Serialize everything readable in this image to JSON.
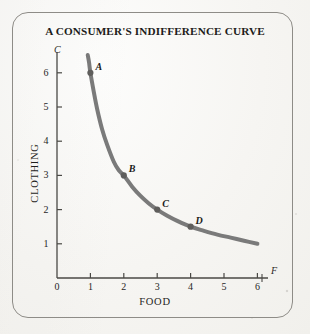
{
  "figure": {
    "title": "A CONSUMER'S INDIFFERENCE CURVE",
    "frame_color": "#8e8c87",
    "background_color": "#f6f5f2",
    "curve_color": "#7a7a7a",
    "axis_color": "#4a4945",
    "text_color": "#1d1c1a"
  },
  "axes": {
    "y_axis_letter": "C",
    "x_axis_letter": "F",
    "y_title": "CLOTHING",
    "x_title": "FOOD",
    "x_ticks": [
      "0",
      "1",
      "2",
      "3",
      "4",
      "5",
      "6"
    ],
    "y_ticks": [
      "1",
      "2",
      "3",
      "4",
      "5",
      "6"
    ]
  },
  "points": [
    {
      "label": "A",
      "x": 1,
      "y": 6
    },
    {
      "label": "B",
      "x": 2,
      "y": 3
    },
    {
      "label": "C",
      "x": 3,
      "y": 2
    },
    {
      "label": "D",
      "x": 4,
      "y": 1.5
    }
  ],
  "chart_data": {
    "type": "line",
    "title": "A CONSUMER'S INDIFFERENCE CURVE",
    "subtitle": "",
    "xlabel": "FOOD",
    "ylabel": "CLOTHING",
    "x_axis_symbol": "F",
    "y_axis_symbol": "C",
    "xlim": [
      0,
      6.4
    ],
    "ylim": [
      0,
      6.6
    ],
    "xticks": [
      0,
      1,
      2,
      3,
      4,
      5,
      6
    ],
    "yticks": [
      1,
      2,
      3,
      4,
      5,
      6
    ],
    "grid": false,
    "legend": null,
    "series": [
      {
        "name": "Indifference curve",
        "color": "#7a7a7a",
        "linewidth": 4,
        "x": [
          0.92,
          0.96,
          1.0,
          1.1,
          1.2,
          1.35,
          1.5,
          1.7,
          1.85,
          2.0,
          2.25,
          2.5,
          2.75,
          3.0,
          3.3,
          3.6,
          4.0,
          4.4,
          4.8,
          5.2,
          5.6,
          6.0
        ],
        "y": [
          6.52,
          6.3,
          6.0,
          5.45,
          4.95,
          4.35,
          3.9,
          3.4,
          3.15,
          3.0,
          2.67,
          2.4,
          2.18,
          2.0,
          1.82,
          1.67,
          1.5,
          1.38,
          1.27,
          1.18,
          1.09,
          1.0
        ]
      }
    ],
    "annotations": [
      {
        "label": "A",
        "x": 1,
        "y": 6
      },
      {
        "label": "B",
        "x": 2,
        "y": 3
      },
      {
        "label": "C",
        "x": 3,
        "y": 2
      },
      {
        "label": "D",
        "x": 4,
        "y": 1.5
      }
    ]
  }
}
